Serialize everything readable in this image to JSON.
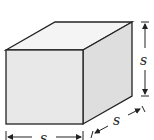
{
  "diagram": {
    "type": "cube",
    "labels": {
      "height": "s",
      "depth": "s",
      "width": "s"
    },
    "colors": {
      "front_face": "#e6e6e6",
      "top_face": "#f5f5f5",
      "side_face": "#dcdcdc",
      "edge": "#222222"
    }
  }
}
